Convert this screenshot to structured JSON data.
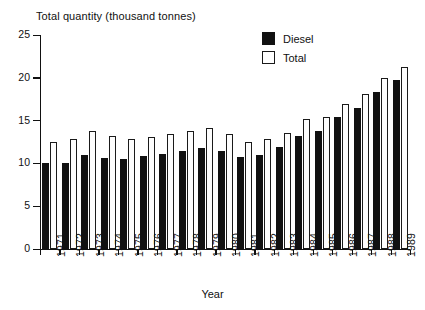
{
  "chart_data": {
    "type": "bar",
    "title": "Total quantity (thousand tonnes)",
    "xlabel": "Year",
    "ylabel": "",
    "ylim": [
      0,
      25
    ],
    "yticks": [
      0,
      5,
      10,
      15,
      20,
      25
    ],
    "grid": false,
    "legend_position": "top-right",
    "categories": [
      "1971",
      "1972",
      "1973",
      "1974",
      "1975",
      "1976",
      "1977",
      "1978",
      "1979",
      "1980",
      "1981",
      "1982",
      "1983",
      "1984",
      "1985",
      "1986",
      "1987",
      "1988",
      "1989"
    ],
    "series": [
      {
        "name": "Diesel",
        "color": "#111111",
        "values": [
          10.0,
          10.0,
          11.0,
          10.6,
          10.5,
          10.9,
          11.1,
          11.5,
          11.8,
          11.4,
          10.7,
          11.0,
          11.9,
          13.2,
          13.8,
          15.4,
          16.5,
          18.3,
          19.7
        ]
      },
      {
        "name": "Total",
        "color": "#ffffff",
        "values": [
          12.5,
          12.8,
          13.8,
          13.2,
          12.8,
          13.1,
          13.4,
          13.8,
          14.1,
          13.4,
          12.5,
          12.9,
          13.6,
          15.2,
          15.4,
          16.9,
          18.1,
          20.0,
          21.3
        ]
      }
    ]
  },
  "legend": {
    "items": [
      {
        "label": "Diesel",
        "style": "filled"
      },
      {
        "label": "Total",
        "style": "hollow"
      }
    ]
  },
  "axis": {
    "y_tick_labels": [
      "25",
      "20",
      "15",
      "10",
      "5",
      "0"
    ],
    "x_title": "Year"
  }
}
